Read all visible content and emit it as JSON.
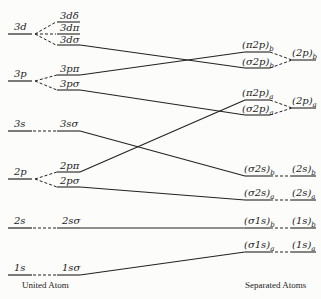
{
  "diagram": {
    "type": "correlation-diagram",
    "left_caption": "United Atom",
    "right_caption": "Separated Atoms",
    "united_atom_levels": [
      {
        "label": "3d",
        "sublevels": [
          "3dδ",
          "3dπ",
          "3dσ"
        ]
      },
      {
        "label": "3p",
        "sublevels": [
          "3pπ",
          "3pσ"
        ]
      },
      {
        "label": "3s",
        "sublevels": [
          "3sσ"
        ]
      },
      {
        "label": "2p",
        "sublevels": [
          "2pπ",
          "2pσ"
        ]
      },
      {
        "label": "2s",
        "sublevels": [
          "2sσ"
        ]
      },
      {
        "label": "1s",
        "sublevels": [
          "1sσ"
        ]
      }
    ],
    "molecular_orbitals": [
      {
        "label": "(π2p)",
        "sub": "b"
      },
      {
        "label": "(σ2p)",
        "sub": "b"
      },
      {
        "label": "(π2p)",
        "sub": "a"
      },
      {
        "label": "(σ2p)",
        "sub": "a"
      },
      {
        "label": "(σ2s)",
        "sub": "b"
      },
      {
        "label": "(σ2s)",
        "sub": "a"
      },
      {
        "label": "(σ1s)",
        "sub": "b"
      },
      {
        "label": "(σ1s)",
        "sub": "a"
      }
    ],
    "separated_atom_levels": [
      {
        "label": "(2p)",
        "sub": "b"
      },
      {
        "label": "(2p)",
        "sub": "a"
      },
      {
        "label": "(2s)",
        "sub": "b"
      },
      {
        "label": "(2s)",
        "sub": "a"
      },
      {
        "label": "(1s)",
        "sub": "b"
      },
      {
        "label": "(1s)",
        "sub": "a"
      }
    ],
    "correlations": [
      {
        "from": "3dσ",
        "to": "(σ2p)b"
      },
      {
        "from": "3pπ",
        "to": "(π2p)b"
      },
      {
        "from": "3pσ",
        "to": "(σ2p)a"
      },
      {
        "from": "3sσ",
        "to": "(σ2s)b"
      },
      {
        "from": "2pπ",
        "to": "(π2p)a"
      },
      {
        "from": "2pσ",
        "to": "(σ2s)a"
      },
      {
        "from": "2sσ",
        "to": "(σ1s)b"
      },
      {
        "from": "1sσ",
        "to": "(σ1s)a"
      }
    ]
  }
}
